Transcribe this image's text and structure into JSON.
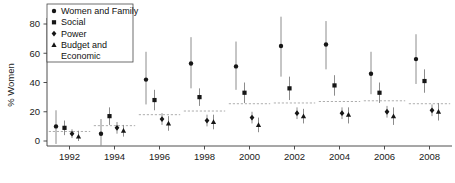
{
  "chart_data": {
    "type": "scatter",
    "title": "",
    "xlabel": "",
    "ylabel": "% Women",
    "ylim": [
      0,
      80
    ],
    "yticks": [
      0,
      20,
      40,
      60,
      80
    ],
    "grid": false,
    "legend_position": "top-left",
    "categories": [
      "1992",
      "1994",
      "1996",
      "1998",
      "2000",
      "2002",
      "2004",
      "2006",
      "2008"
    ],
    "error_bars": "vertical confidence intervals",
    "reference_lines": {
      "style": "dashed horizontal segment per election year",
      "values": [
        6.5,
        10.5,
        18.0,
        20.5,
        25.5,
        26.0,
        27.0,
        27.5,
        25.5
      ]
    },
    "series": [
      {
        "name": "Women and Family",
        "marker": "circle",
        "values": [
          10,
          5,
          42,
          53,
          51,
          65,
          66,
          46,
          56
        ],
        "ci_low": [
          -2,
          -3,
          25,
          36,
          35,
          44,
          49,
          32,
          39
        ],
        "ci_high": [
          21,
          15,
          61,
          71,
          68,
          85,
          82,
          61,
          73
        ]
      },
      {
        "name": "Social",
        "marker": "square",
        "values": [
          9,
          17,
          28,
          30,
          33,
          36,
          38,
          33,
          41
        ],
        "ci_low": [
          4,
          11,
          21,
          24,
          26,
          28,
          31,
          26,
          33
        ],
        "ci_high": [
          14,
          23,
          35,
          36,
          40,
          44,
          45,
          40,
          49
        ]
      },
      {
        "name": "Power",
        "marker": "diamond",
        "values": [
          5,
          9,
          15,
          14,
          16,
          19,
          19,
          20,
          21
        ],
        "ci_low": [
          2,
          5,
          11,
          10,
          12,
          15,
          15,
          16,
          17
        ],
        "ci_high": [
          8,
          13,
          19,
          18,
          20,
          23,
          23,
          24,
          25
        ]
      },
      {
        "name": "Budget and Economic",
        "marker": "triangle",
        "values": [
          3,
          7,
          12,
          13,
          11,
          17,
          18,
          17,
          20
        ],
        "ci_low": [
          0,
          3,
          7,
          8,
          6,
          12,
          12,
          11,
          14
        ],
        "ci_high": [
          7,
          11,
          17,
          18,
          16,
          22,
          23,
          23,
          26
        ]
      }
    ]
  },
  "axis": {
    "y_title": "% Women",
    "y_ticks": [
      "0",
      "20",
      "40",
      "60",
      "80"
    ],
    "x_ticks": [
      "1992",
      "1994",
      "1996",
      "1998",
      "2000",
      "2002",
      "2004",
      "2006",
      "2008"
    ]
  },
  "legend": {
    "items": [
      {
        "label": "Women and Family",
        "marker": "circle"
      },
      {
        "label": "Social",
        "marker": "square"
      },
      {
        "label": "Power",
        "marker": "diamond"
      },
      {
        "label": "Budget and",
        "marker": "triangle"
      },
      {
        "label": "Economic",
        "marker": "none"
      }
    ]
  }
}
